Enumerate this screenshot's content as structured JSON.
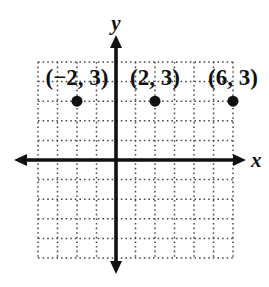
{
  "figure": {
    "background": "#ffffff",
    "ink_color": "#111111",
    "grid_color": "#4a4a4a"
  },
  "chart_data": {
    "type": "scatter",
    "xlabel": "x",
    "ylabel": "y",
    "xlim": [
      -4,
      6
    ],
    "ylim": [
      -5,
      5
    ],
    "grid": true,
    "grid_style": "dotted",
    "legend": "none",
    "points": [
      {
        "x": -2,
        "y": 3,
        "label": "(−2, 3)"
      },
      {
        "x": 2,
        "y": 3,
        "label": "(2, 3)"
      },
      {
        "x": 6,
        "y": 3,
        "label": "(6, 3)"
      }
    ]
  }
}
